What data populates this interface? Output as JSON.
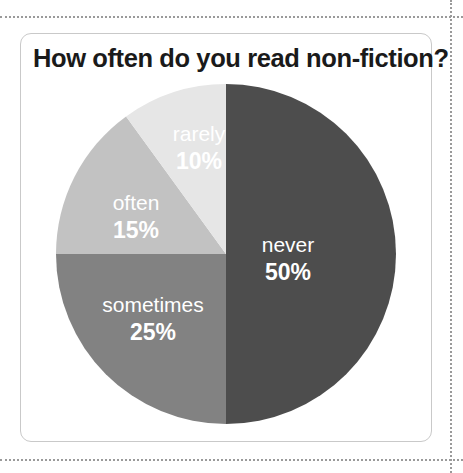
{
  "page": {
    "background_color": "#ffffff",
    "rules": {
      "style": "dotted",
      "color": "#9a9a9a",
      "positions": [
        "top",
        "right",
        "bottom"
      ]
    }
  },
  "card": {
    "border_color": "#c9c9c9",
    "background_color": "#ffffff"
  },
  "chart_data": {
    "type": "pie",
    "title": "How often do you read non-fiction?",
    "xlabel": "",
    "ylabel": "",
    "legend_position": "none",
    "labels_inside_slices": true,
    "value_suffix": "%",
    "categories": [
      "never",
      "sometimes",
      "often",
      "rarely"
    ],
    "values": [
      50,
      25,
      15,
      10
    ],
    "start_angle_deg": 0,
    "direction": "clockwise",
    "slices": [
      {
        "label": "never",
        "value": 50,
        "value_text": "50%",
        "color": "#4d4d4d",
        "start_deg": 0,
        "end_deg": 180,
        "label_x": 232,
        "label_y": 168,
        "value_x": 232,
        "value_y": 196
      },
      {
        "label": "sometimes",
        "value": 25,
        "value_text": "25%",
        "color": "#828282",
        "start_deg": 180,
        "end_deg": 270,
        "label_x": 97,
        "label_y": 228,
        "value_x": 97,
        "value_y": 256
      },
      {
        "label": "often",
        "value": 15,
        "value_text": "15%",
        "color": "#c2c2c2",
        "start_deg": 270,
        "end_deg": 324,
        "label_x": 80,
        "label_y": 126,
        "value_x": 80,
        "value_y": 154
      },
      {
        "label": "rarely",
        "value": 10,
        "value_text": "10%",
        "color": "#e6e6e6",
        "start_deg": 324,
        "end_deg": 360,
        "label_x": 143,
        "label_y": 57,
        "value_x": 143,
        "value_y": 85
      }
    ]
  }
}
